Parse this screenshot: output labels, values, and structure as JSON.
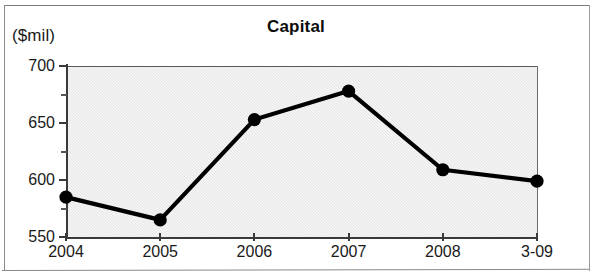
{
  "chart_data": {
    "type": "line",
    "title": "Capital",
    "ylabel": "($mil)",
    "xlabel": "",
    "categories": [
      "2004",
      "2005",
      "2006",
      "2007",
      "2008",
      "3-09"
    ],
    "values": [
      585,
      565,
      653,
      678,
      609,
      599
    ],
    "series": [
      {
        "name": "Capital",
        "values": [
          585,
          565,
          653,
          678,
          609,
          599
        ]
      }
    ],
    "ylim": [
      550,
      700
    ],
    "ytick_labels": [
      "700",
      "650",
      "600",
      "550"
    ],
    "ytick_values": [
      700,
      650,
      600,
      550
    ],
    "yminor_values": [
      675,
      625,
      575
    ],
    "grid": false,
    "legend": null,
    "marker": "filled-circle",
    "line_color": "#000000",
    "marker_color": "#000000",
    "plot_background": "#e6e6e6"
  },
  "figure": {
    "title": "Capital",
    "unit_label": "($mil)"
  }
}
